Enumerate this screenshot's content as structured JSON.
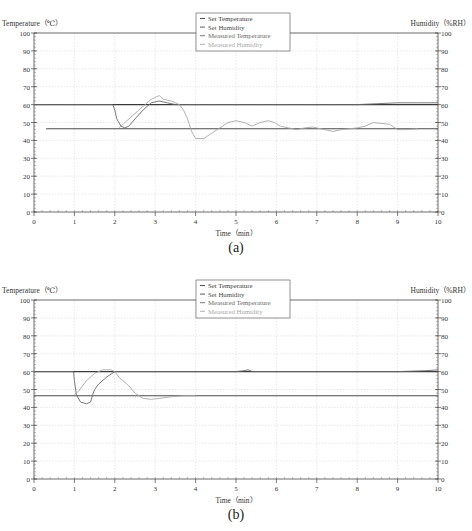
{
  "chart_data": [
    {
      "id": "a",
      "type": "line",
      "caption": "(a)",
      "xlabel": "Time（min）",
      "ylabel_left": "Temperature（℃）",
      "ylabel_right": "Humidity（%RH）",
      "xlim": [
        0,
        10
      ],
      "ylim_left": [
        0,
        100
      ],
      "ylim_right": [
        0,
        100
      ],
      "x_ticks": [
        "0",
        "1",
        "2",
        "3",
        "4",
        "5",
        "6",
        "7",
        "8",
        "9",
        "10"
      ],
      "y_ticks_left": [
        "0",
        "10",
        "20",
        "30",
        "40",
        "50",
        "60",
        "70",
        "80",
        "90",
        "100"
      ],
      "y_ticks_right": [
        "0",
        "10",
        "20",
        "30",
        "40",
        "50",
        "60",
        "70",
        "80",
        "90",
        "100"
      ],
      "grid": true,
      "legend_position": "top-center",
      "legend": [
        "Set Temperature",
        "Set Humidity",
        "Measured Temperature",
        "Measured Humidity"
      ],
      "series": [
        {
          "name": "Set Temperature",
          "axis": "left",
          "color": "#3a3a3a",
          "x": [
            0,
            2.0,
            2.0,
            10
          ],
          "y": [
            60,
            60,
            60,
            60
          ]
        },
        {
          "name": "Set Humidity",
          "axis": "right",
          "color": "#4a4a4a",
          "x": [
            0.3,
            0.35,
            0.9,
            10
          ],
          "y": [
            46.5,
            46.5,
            46.5,
            46.5
          ]
        },
        {
          "name": "Measured Temperature",
          "axis": "left",
          "color": "#6a6a6a",
          "x": [
            0,
            1.95,
            2.0,
            2.05,
            2.15,
            2.25,
            2.35,
            2.5,
            2.7,
            2.9,
            3.1,
            3.3,
            3.5,
            4,
            5,
            6,
            7,
            8,
            8.5,
            9,
            9.5,
            10
          ],
          "y": [
            60,
            60,
            57,
            52,
            48,
            47,
            48,
            52,
            57,
            61,
            62,
            61,
            60,
            60,
            60,
            60,
            60,
            60,
            60.5,
            61,
            61,
            61
          ]
        },
        {
          "name": "Measured Humidity",
          "axis": "right",
          "color": "#a8a8a8",
          "x": [
            2.1,
            2.2,
            2.3,
            2.5,
            2.7,
            2.9,
            3.0,
            3.1,
            3.2,
            3.4,
            3.6,
            3.7,
            3.8,
            3.9,
            4.0,
            4.2,
            4.4,
            4.6,
            4.8,
            5.0,
            5.2,
            5.4,
            5.6,
            5.8,
            5.95,
            6.1,
            6.3,
            6.5,
            6.7,
            6.9,
            7.0,
            7.2,
            7.4,
            7.6,
            7.8,
            8.0,
            8.2,
            8.4,
            8.6,
            8.8,
            9.0,
            9.2,
            9.5
          ],
          "y": [
            47,
            49,
            51,
            55,
            59,
            63,
            64,
            65,
            63,
            62,
            60,
            57,
            52,
            45,
            41,
            41,
            44,
            47,
            50,
            51,
            50,
            48,
            50,
            51,
            50,
            48,
            47,
            46,
            47,
            47.5,
            47,
            46,
            45,
            46,
            46.5,
            47,
            48,
            50,
            49.5,
            49,
            46,
            46,
            46.5
          ]
        }
      ]
    },
    {
      "id": "b",
      "type": "line",
      "caption": "(b)",
      "xlabel": "Time（min）",
      "ylabel_left": "Temperature（℃）",
      "ylabel_right": "Humidity（%RH）",
      "xlim": [
        0,
        10
      ],
      "ylim_left": [
        0,
        100
      ],
      "ylim_right": [
        0,
        100
      ],
      "x_ticks": [
        "0",
        "1",
        "2",
        "3",
        "4",
        "5",
        "6",
        "7",
        "8",
        "9",
        "10"
      ],
      "y_ticks_left": [
        "0",
        "10",
        "20",
        "30",
        "40",
        "50",
        "60",
        "70",
        "80",
        "90",
        "100"
      ],
      "y_ticks_right": [
        "0",
        "10",
        "20",
        "30",
        "40",
        "50",
        "60",
        "70",
        "80",
        "90",
        "100"
      ],
      "grid": true,
      "legend_position": "top-center",
      "legend": [
        "Set Temperature",
        "Set Humidity",
        "Measured Temperature",
        "Measured Humidity"
      ],
      "series": [
        {
          "name": "Set Temperature",
          "axis": "left",
          "color": "#3a3a3a",
          "x": [
            0,
            1.0,
            1.0,
            10
          ],
          "y": [
            60,
            60,
            60,
            60
          ]
        },
        {
          "name": "Set Humidity",
          "axis": "right",
          "color": "#4a4a4a",
          "x": [
            0,
            10
          ],
          "y": [
            46.5,
            46.5
          ]
        },
        {
          "name": "Measured Temperature",
          "axis": "left",
          "color": "#6a6a6a",
          "x": [
            0,
            0.98,
            1.0,
            1.05,
            1.15,
            1.3,
            1.4,
            1.45,
            1.5,
            1.6,
            1.8,
            2.0,
            2.2,
            3,
            4,
            5,
            5.2,
            5.3,
            5.4,
            6,
            7,
            8,
            9,
            9.7,
            10
          ],
          "y": [
            60,
            60,
            55,
            47,
            43,
            42,
            43,
            47,
            50,
            53,
            57,
            60,
            60,
            60,
            60,
            60,
            60.5,
            61,
            60,
            60,
            60,
            60,
            60,
            60.5,
            61
          ]
        },
        {
          "name": "Measured Humidity",
          "axis": "right",
          "color": "#a8a8a8",
          "x": [
            1.0,
            1.1,
            1.2,
            1.3,
            1.5,
            1.7,
            1.9,
            2.0,
            2.1,
            2.2,
            2.35,
            2.5,
            2.7,
            2.9,
            3.1,
            3.4,
            3.7,
            4.0
          ],
          "y": [
            47,
            49,
            52,
            55,
            59,
            61,
            61,
            60,
            57,
            55,
            52,
            48,
            45,
            44.5,
            45,
            46,
            46.5,
            46.5
          ]
        }
      ]
    }
  ]
}
